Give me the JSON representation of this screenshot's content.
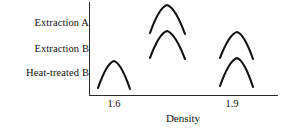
{
  "chart_data": {
    "type": "line",
    "title": "",
    "subtitle": "",
    "xlabel": "Density",
    "ylabel": "",
    "grid": false,
    "legend_position": "left-row-labels",
    "xlim": [
      1.48,
      2.02
    ],
    "xticks": [
      1.6,
      1.9
    ],
    "xtick_labels": [
      "1.6",
      "1.9"
    ],
    "row_labels": [
      "Extraction A",
      "Extraction B",
      "Heat-treated B"
    ],
    "series": [
      {
        "name": "Extraction A",
        "row": 0,
        "peaks": [
          {
            "center": 1.73,
            "label": "high-density peak",
            "x_left": 150,
            "x_peak": 167,
            "x_right": 185,
            "y_peak": 5,
            "y_base": 33
          }
        ]
      },
      {
        "name": "Extraction B",
        "row": 1,
        "peaks": [
          {
            "center": 1.73,
            "label": "high-density peak",
            "x_left": 150,
            "x_peak": 167,
            "x_right": 185,
            "y_peak": 31,
            "y_base": 58
          },
          {
            "center": 1.9,
            "label": "low-density peak",
            "x_left": 220,
            "x_peak": 237,
            "x_right": 253,
            "y_peak": 32,
            "y_base": 58
          }
        ]
      },
      {
        "name": "Heat-treated B",
        "row": 2,
        "peaks": [
          {
            "center": 1.6,
            "label": "low-density peak",
            "x_left": 98,
            "x_peak": 114,
            "x_right": 130,
            "y_peak": 61,
            "y_base": 88
          },
          {
            "center": 1.9,
            "label": "low-density peak",
            "x_left": 220,
            "x_peak": 237,
            "x_right": 253,
            "y_peak": 58,
            "y_base": 86
          }
        ]
      }
    ]
  },
  "axis": {
    "x_title": "Density",
    "tick_left": "1.6",
    "tick_right": "1.9"
  },
  "labels": {
    "row_0": "Extraction A",
    "row_1": "Extraction B",
    "row_2": "Heat-treated B"
  },
  "colors": {
    "ink": "#111111",
    "axis": "#2a2a2a",
    "background": "#ffffff"
  }
}
